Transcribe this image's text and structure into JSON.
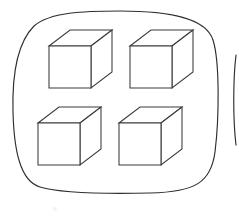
{
  "figure": {
    "title": "Four cubes grouped inside one enclosure",
    "kind": "grouping-diagram",
    "background_color": "#ffffff",
    "stroke_color": "#2e2e2e",
    "cube_stroke_color": "#3a3a3a",
    "fill_color": "#ffffff"
  },
  "enclosures": [
    {
      "name": "primary-group",
      "label": "",
      "outline": "M 120 11 C 170 11 206 18 213 40 C 220 62 219 120 215 152 C 211 182 196 192 150 193 C 104 194 60 193 40 187 C 20 181 14 150 13 112 C 12 74 18 42 34 26 C 50 12 84 11 120 11 Z",
      "item_count": 4,
      "item_count_label": "4"
    },
    {
      "name": "secondary-group-partial",
      "label": "",
      "outline": "M 236 55 C 233 80 233 120 236 145",
      "item_count": 0,
      "item_count_label": ""
    }
  ],
  "cubes": [
    {
      "name": "cube-top-left",
      "label": "",
      "front": "49,46 91,46 91,88 49,88",
      "top": "49,46 70,30 112,30 91,46",
      "side": "91,46 112,30 112,72 91,88"
    },
    {
      "name": "cube-top-right",
      "label": "",
      "front": "130,46 172,46 172,88 130,88",
      "top": "130,46 151,30 193,30 172,46",
      "side": "172,46 193,30 193,72 172,88"
    },
    {
      "name": "cube-bottom-left",
      "label": "",
      "front": "38,123 80,123 80,165 38,165",
      "top": "38,123 59,107 101,107 80,123",
      "side": "80,123 101,107 101,149 80,165"
    },
    {
      "name": "cube-bottom-right",
      "label": "",
      "front": "119,123 161,123 161,165 119,165",
      "top": "119,123 140,107 182,107 161,123",
      "side": "161,123 182,107 182,149 161,165"
    }
  ],
  "artifacts": [
    {
      "name": "faint-smudge",
      "label": "",
      "x": 55,
      "y": 209,
      "radius": 2
    }
  ]
}
